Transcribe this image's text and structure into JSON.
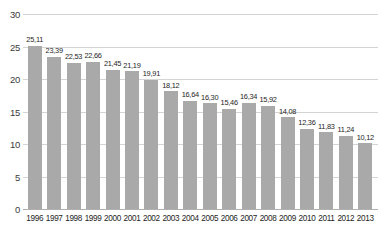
{
  "chart_data": {
    "type": "bar",
    "title": "",
    "xlabel": "",
    "ylabel": "",
    "ylim": [
      0,
      30
    ],
    "yticks": [
      0,
      5,
      10,
      15,
      20,
      25,
      30
    ],
    "ytick_labels": [
      "0",
      "5",
      "10",
      "15",
      "20",
      "25",
      "30"
    ],
    "grid": true,
    "legend": "none",
    "decimal_separator": ",",
    "bar_color": "#a9a9a9",
    "gridline_color": "#d4d4d4",
    "categories": [
      "1996",
      "1997",
      "1998",
      "1999",
      "2000",
      "2001",
      "2002",
      "2003",
      "2004",
      "2005",
      "2006",
      "2007",
      "2008",
      "2009",
      "2010",
      "2011",
      "2012",
      "2013"
    ],
    "values": [
      25.11,
      23.39,
      22.53,
      22.66,
      21.45,
      21.19,
      19.91,
      18.12,
      16.64,
      16.3,
      15.46,
      16.34,
      15.92,
      14.08,
      12.36,
      11.83,
      11.24,
      10.12
    ],
    "value_labels": [
      "25,11",
      "23,39",
      "22,53",
      "22,66",
      "21,45",
      "21,19",
      "19,91",
      "18,12",
      "16,64",
      "16,30",
      "15,46",
      "16,34",
      "15,92",
      "14,08",
      "12,36",
      "11,83",
      "11,24",
      "10,12"
    ]
  }
}
